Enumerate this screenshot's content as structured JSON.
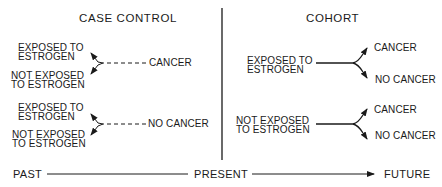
{
  "diagram": {
    "sections": {
      "case_control": {
        "title": "CASE CONTROL",
        "groups": [
          {
            "outcome": "CANCER",
            "exposures": [
              {
                "line1": "EXPOSED TO",
                "line2": "ESTROGEN"
              },
              {
                "line1": "NOT EXPOSED",
                "line2": "TO ESTROGEN"
              }
            ]
          },
          {
            "outcome": "NO CANCER",
            "exposures": [
              {
                "line1": "EXPOSED TO",
                "line2": "ESTROGEN"
              },
              {
                "line1": "NOT EXPOSED",
                "line2": "TO ESTROGEN"
              }
            ]
          }
        ]
      },
      "cohort": {
        "title": "COHORT",
        "groups": [
          {
            "exposure": {
              "line1": "EXPOSED TO",
              "line2": "ESTROGEN"
            },
            "outcomes": [
              "CANCER",
              "NO CANCER"
            ]
          },
          {
            "exposure": {
              "line1": "NOT EXPOSED",
              "line2": "TO ESTROGEN"
            },
            "outcomes": [
              "CANCER",
              "NO CANCER"
            ]
          }
        ]
      }
    },
    "timeline": {
      "past": "PAST",
      "present": "PRESENT",
      "future": "FUTURE"
    },
    "colors": {
      "ink": "#1a1a1a",
      "background": "#ffffff"
    }
  }
}
